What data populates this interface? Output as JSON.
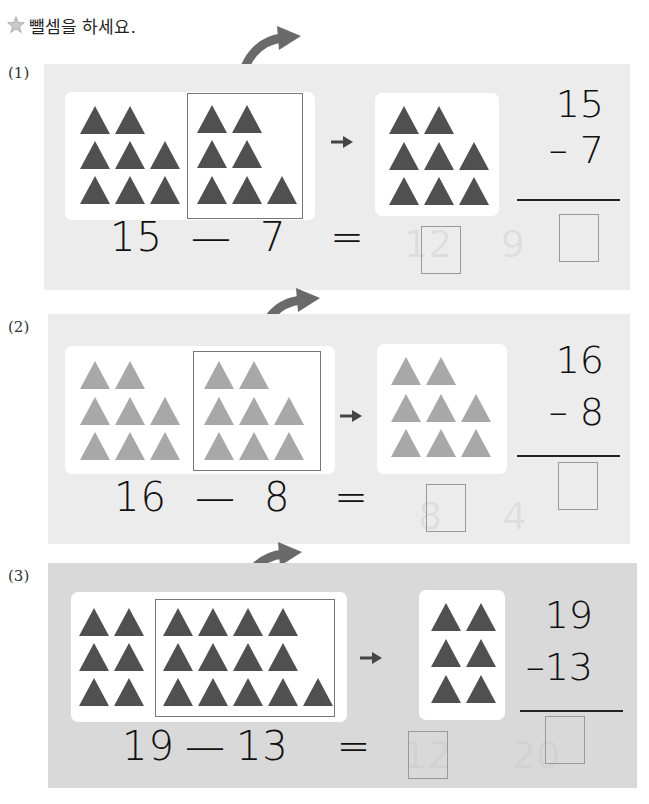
{
  "header": {
    "instruction": "뺄셈을 하세요.",
    "star_icon": "star-icon"
  },
  "colors": {
    "panel_bg": "#ececec",
    "panel_bg_dark": "#d9d9d9",
    "triangle_dark": "#505050",
    "triangle_light": "#a8a8a8",
    "arrow": "#6a6a6a"
  },
  "problems": [
    {
      "label": "(1)",
      "minuend": "15",
      "subtrahend": "7",
      "minus": "—",
      "equals": "=",
      "vertical_top": "15",
      "vertical_bottom": "– 7",
      "left_triangles": 8,
      "boxed_triangles": 7,
      "remaining_triangles": 8,
      "triangle_shade": "dark",
      "answer_horizontal": "",
      "answer_vertical": ""
    },
    {
      "label": "(2)",
      "minuend": "16",
      "subtrahend": "8",
      "minus": "—",
      "equals": "=",
      "vertical_top": "16",
      "vertical_bottom": "– 8",
      "left_triangles": 8,
      "boxed_triangles": 8,
      "remaining_triangles": 8,
      "triangle_shade": "light",
      "answer_horizontal": "",
      "answer_vertical": ""
    },
    {
      "label": "(3)",
      "minuend": "19",
      "subtrahend": "13",
      "minus": "—",
      "equals": "=",
      "vertical_top": "19",
      "vertical_bottom": "–13",
      "left_triangles": 6,
      "boxed_triangles": 13,
      "remaining_triangles": 6,
      "triangle_shade": "dark",
      "answer_horizontal": "",
      "answer_vertical": ""
    }
  ]
}
